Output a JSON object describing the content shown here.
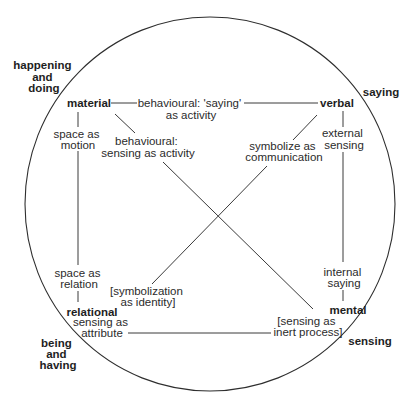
{
  "diagram": {
    "type": "process-types-circle",
    "outer_labels": {
      "top_left": [
        "happening",
        "and",
        "doing"
      ],
      "top_right": [
        "saying"
      ],
      "bottom_left": [
        "being",
        "and",
        "having"
      ],
      "bottom_right": [
        "sensing"
      ]
    },
    "nodes": {
      "material": "material",
      "verbal": "verbal",
      "relational": "relational",
      "mental": "mental"
    },
    "edge_labels": {
      "material_verbal": [
        "behavioural: 'saying'",
        "as activity"
      ],
      "material_mental": [
        "behavioural:",
        "sensing as activity"
      ],
      "material_relational_top": [
        "space as",
        "motion"
      ],
      "material_relational_bottom": [
        "space as",
        "relation"
      ],
      "verbal_relational_top": [
        "symbolize as",
        "communication"
      ],
      "verbal_relational_bottom": [
        "[symbolization",
        "as identity]"
      ],
      "verbal_mental_top": [
        "external",
        "sensing"
      ],
      "verbal_mental_bottom": [
        "internal",
        "saying"
      ],
      "relational_mental_left": [
        "sensing as",
        "attribute"
      ],
      "relational_mental_right": [
        "[sensing as",
        "inert process]"
      ]
    },
    "colors": {
      "line": "#3a3a3a",
      "text": "#2b2b2b",
      "background": "#ffffff"
    }
  }
}
